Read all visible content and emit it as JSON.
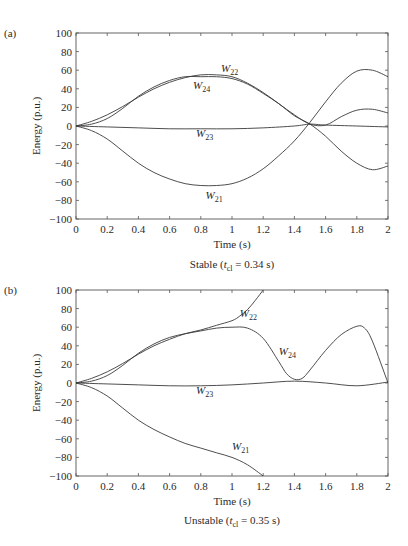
{
  "chart_data": [
    {
      "type": "line",
      "panel_label": "(a)",
      "caption": "Stable (t_cl = 0.34 s)",
      "caption_parts": {
        "prefix": "Stable (",
        "t": "t",
        "sub": "cl",
        "suffix": " = 0.34 s)"
      },
      "xlabel": "Time (s)",
      "ylabel": "Energy (p.u.)",
      "xlim": [
        0,
        2
      ],
      "ylim": [
        -100,
        100
      ],
      "xticks": [
        0,
        0.2,
        0.4,
        0.6,
        0.8,
        1,
        1.2,
        1.4,
        1.6,
        1.8,
        2
      ],
      "xtick_labels": [
        "0",
        "0.2",
        "0.4",
        "0.6",
        "0.8",
        "1",
        "1.2",
        "1.4",
        "1.6",
        "1.8",
        "2"
      ],
      "yticks": [
        -100,
        -80,
        -60,
        -40,
        -20,
        0,
        20,
        40,
        60,
        80,
        100
      ],
      "ytick_labels": [
        "−100",
        "−80",
        "−60",
        "−40",
        "−20",
        "0",
        "20",
        "40",
        "60",
        "80",
        "100"
      ],
      "grid": false,
      "series": [
        {
          "name": "W22",
          "label_main": "W",
          "label_sub": "22",
          "label_pos": [
            0.93,
            58
          ],
          "x": [
            0,
            0.1,
            0.2,
            0.3,
            0.4,
            0.5,
            0.6,
            0.7,
            0.8,
            0.9,
            1.0,
            1.1,
            1.2,
            1.3,
            1.4,
            1.5,
            1.6,
            1.7,
            1.8,
            1.9,
            2.0
          ],
          "y": [
            0,
            5,
            12,
            21,
            31,
            40,
            47,
            52,
            55,
            55,
            53,
            46,
            36,
            24,
            12,
            2,
            1,
            10,
            17,
            18,
            14
          ]
        },
        {
          "name": "W24",
          "label_main": "W",
          "label_sub": "24",
          "label_pos": [
            0.75,
            40
          ],
          "x": [
            0,
            0.1,
            0.2,
            0.3,
            0.4,
            0.5,
            0.6,
            0.7,
            0.8,
            0.9,
            1.0,
            1.1,
            1.2,
            1.3,
            1.4,
            1.5,
            1.6,
            1.7,
            1.8,
            1.9,
            2.0
          ],
          "y": [
            0,
            2,
            8,
            19,
            32,
            42,
            49,
            53,
            53,
            53,
            51,
            45,
            35,
            24,
            11,
            2,
            -11,
            -27,
            -40,
            -47,
            -43
          ]
        },
        {
          "name": "W23",
          "label_main": "W",
          "label_sub": "23",
          "label_pos": [
            0.77,
            -12
          ],
          "x": [
            0,
            0.2,
            0.4,
            0.6,
            0.8,
            1.0,
            1.2,
            1.4,
            1.5,
            1.6,
            1.8,
            2.0
          ],
          "y": [
            0,
            -1,
            -2,
            -3,
            -3,
            -3,
            -2,
            0,
            2,
            1,
            0,
            -1
          ]
        },
        {
          "name": "W21",
          "label_main": "W",
          "label_sub": "21",
          "label_pos": [
            0.83,
            -78
          ],
          "x": [
            0,
            0.1,
            0.2,
            0.3,
            0.4,
            0.5,
            0.6,
            0.7,
            0.8,
            0.9,
            1.0,
            1.1,
            1.2,
            1.3,
            1.4,
            1.5,
            1.6,
            1.7,
            1.8,
            1.9,
            2.0
          ],
          "y": [
            0,
            -5,
            -14,
            -27,
            -40,
            -50,
            -57,
            -62,
            -64,
            -64,
            -62,
            -56,
            -46,
            -32,
            -16,
            4,
            26,
            46,
            59,
            60,
            53
          ]
        }
      ]
    },
    {
      "type": "line",
      "panel_label": "(b)",
      "caption": "Unstable (t_cl = 0.35 s)",
      "caption_parts": {
        "prefix": "Unstable (",
        "t": "t",
        "sub": "cl",
        "suffix": " = 0.35 s)"
      },
      "xlabel": "Time (s)",
      "ylabel": "Energy (p.u.)",
      "xlim": [
        0,
        2
      ],
      "ylim": [
        -100,
        100
      ],
      "xticks": [
        0,
        0.2,
        0.4,
        0.6,
        0.8,
        1,
        1.2,
        1.4,
        1.6,
        1.8,
        2
      ],
      "xtick_labels": [
        "0",
        "0.2",
        "0.4",
        "0.6",
        "0.8",
        "1",
        "1.2",
        "1.4",
        "1.6",
        "1.8",
        "2"
      ],
      "yticks": [
        -100,
        -80,
        -60,
        -40,
        -20,
        0,
        20,
        40,
        60,
        80,
        100
      ],
      "ytick_labels": [
        "−100",
        "−80",
        "−60",
        "−40",
        "−20",
        "0",
        "20",
        "40",
        "60",
        "80",
        "100"
      ],
      "grid": false,
      "series": [
        {
          "name": "W22",
          "label_main": "W",
          "label_sub": "22",
          "label_pos": [
            1.05,
            71
          ],
          "x": [
            0,
            0.1,
            0.2,
            0.3,
            0.4,
            0.5,
            0.6,
            0.7,
            0.8,
            0.9,
            1.0,
            1.05,
            1.1,
            1.15,
            1.2
          ],
          "y": [
            0,
            5,
            12,
            21,
            31,
            40,
            47,
            53,
            57,
            62,
            67,
            72,
            79,
            89,
            100
          ]
        },
        {
          "name": "W24",
          "label_main": "W",
          "label_sub": "24",
          "label_pos": [
            1.3,
            30
          ],
          "x": [
            0,
            0.1,
            0.2,
            0.3,
            0.4,
            0.5,
            0.6,
            0.7,
            0.8,
            0.9,
            1.0,
            1.1,
            1.2,
            1.3,
            1.35,
            1.4,
            1.45,
            1.5,
            1.6,
            1.7,
            1.8,
            1.85,
            1.9,
            2.0
          ],
          "y": [
            0,
            2,
            8,
            19,
            32,
            42,
            49,
            53,
            56,
            59,
            60,
            59,
            48,
            23,
            10,
            4,
            5,
            14,
            35,
            52,
            61,
            59,
            45,
            0
          ]
        },
        {
          "name": "W23",
          "label_main": "W",
          "label_sub": "23",
          "label_pos": [
            0.77,
            -12
          ],
          "x": [
            0,
            0.2,
            0.4,
            0.6,
            0.8,
            1.0,
            1.2,
            1.4,
            1.6,
            1.8,
            2.0
          ],
          "y": [
            0,
            -1,
            -2,
            -3,
            -3,
            -2,
            0,
            2,
            0,
            -3,
            1
          ]
        },
        {
          "name": "W21",
          "label_main": "W",
          "label_sub": "21",
          "label_pos": [
            1.0,
            -72
          ],
          "x": [
            0,
            0.1,
            0.2,
            0.3,
            0.4,
            0.5,
            0.6,
            0.7,
            0.8,
            0.9,
            1.0,
            1.1,
            1.2
          ],
          "y": [
            0,
            -5,
            -14,
            -27,
            -40,
            -50,
            -58,
            -65,
            -70,
            -75,
            -80,
            -88,
            -100
          ]
        }
      ]
    }
  ],
  "panels": [
    {
      "label": "(a)",
      "caption": "Stable (t_cl = 0.34 s)"
    },
    {
      "label": "(b)",
      "caption": "Unstable (t_cl = 0.35 s)"
    }
  ]
}
